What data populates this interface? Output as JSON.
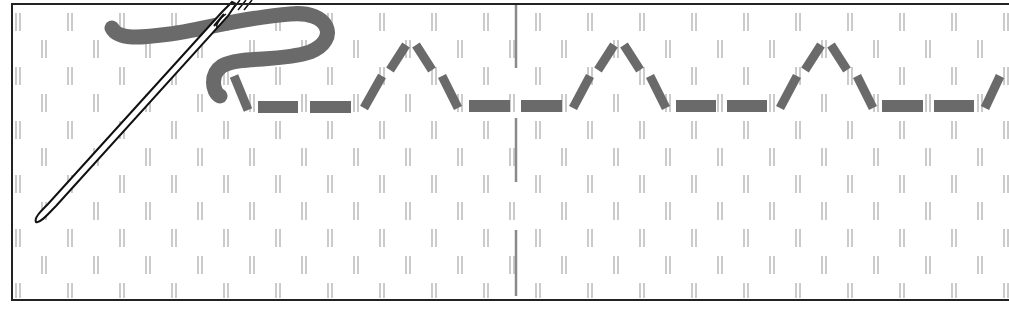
{
  "diagram": {
    "colors": {
      "background": "#ffffff",
      "frame": "#222222",
      "grid_marks": "#a8a8a8",
      "center_line": "#8a8a8a",
      "thread": "#6a6a6a",
      "needle_outline": "#111111"
    },
    "grid": {
      "row_pitch": 27,
      "col_pitch": 52,
      "first_row_y": 22,
      "rows": 11,
      "odd_row_first_x": 18,
      "even_row_first_x": 44
    },
    "frame": {
      "x": 12,
      "y": 4,
      "width": 998,
      "height": 296
    },
    "center_line_x": 516,
    "stitches": [
      {
        "type": "diag",
        "pts": [
          [
            234,
            76
          ],
          [
            248,
            110
          ]
        ]
      },
      {
        "type": "bar",
        "x": 258,
        "y": 101,
        "w": 40,
        "h": 12
      },
      {
        "type": "bar",
        "x": 310,
        "y": 101,
        "w": 41,
        "h": 12
      },
      {
        "type": "diag",
        "pts": [
          [
            364,
            108
          ],
          [
            382,
            76
          ]
        ]
      },
      {
        "type": "diag",
        "pts": [
          [
            390,
            70
          ],
          [
            406,
            45
          ]
        ]
      },
      {
        "type": "diag",
        "pts": [
          [
            416,
            45
          ],
          [
            432,
            70
          ]
        ]
      },
      {
        "type": "diag",
        "pts": [
          [
            442,
            76
          ],
          [
            458,
            108
          ]
        ]
      },
      {
        "type": "bar",
        "x": 469,
        "y": 100,
        "w": 41,
        "h": 12
      },
      {
        "type": "bar",
        "x": 521,
        "y": 100,
        "w": 41,
        "h": 12
      },
      {
        "type": "diag",
        "pts": [
          [
            573,
            108
          ],
          [
            590,
            76
          ]
        ]
      },
      {
        "type": "diag",
        "pts": [
          [
            598,
            70
          ],
          [
            614,
            45
          ]
        ]
      },
      {
        "type": "diag",
        "pts": [
          [
            624,
            45
          ],
          [
            640,
            70
          ]
        ]
      },
      {
        "type": "diag",
        "pts": [
          [
            650,
            76
          ],
          [
            666,
            108
          ]
        ]
      },
      {
        "type": "bar",
        "x": 676,
        "y": 100,
        "w": 40,
        "h": 12
      },
      {
        "type": "bar",
        "x": 727,
        "y": 100,
        "w": 40,
        "h": 12
      },
      {
        "type": "diag",
        "pts": [
          [
            780,
            108
          ],
          [
            797,
            76
          ]
        ]
      },
      {
        "type": "diag",
        "pts": [
          [
            805,
            70
          ],
          [
            821,
            45
          ]
        ]
      },
      {
        "type": "diag",
        "pts": [
          [
            831,
            45
          ],
          [
            847,
            70
          ]
        ]
      },
      {
        "type": "diag",
        "pts": [
          [
            857,
            76
          ],
          [
            873,
            108
          ]
        ]
      },
      {
        "type": "bar",
        "x": 882,
        "y": 100,
        "w": 41,
        "h": 12
      },
      {
        "type": "bar",
        "x": 934,
        "y": 100,
        "w": 40,
        "h": 12
      },
      {
        "type": "diag",
        "pts": [
          [
            985,
            108
          ],
          [
            1000,
            76
          ]
        ]
      }
    ]
  }
}
